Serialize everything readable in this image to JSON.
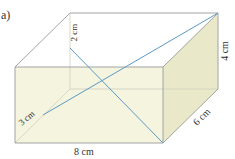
{
  "part_label": "a)",
  "figure": {
    "type": "cuboid",
    "labels": {
      "height_right": "4 cm",
      "depth": "6 cm",
      "width": "8 cm",
      "top_segment": "2 cm",
      "bottom_segment": "3 cm"
    },
    "colors": {
      "front_face": "#f4f4df",
      "side_face": "#e9e9c9",
      "edge": "#9a9a9a",
      "hidden_edge": "#c8c8c8",
      "diagonal": "#5b9ac6",
      "background": "#ffffff"
    }
  }
}
